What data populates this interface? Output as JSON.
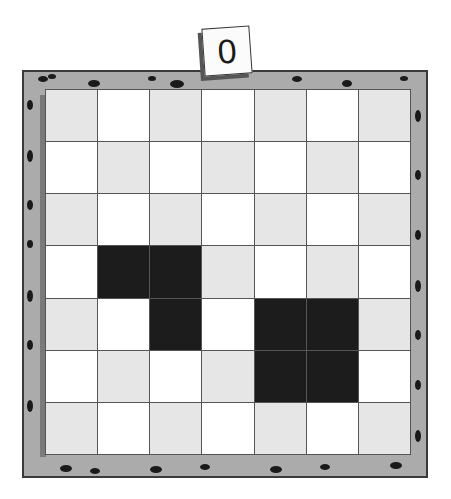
{
  "game": {
    "title": "Grid puzzle board",
    "score": "0",
    "rows": 7,
    "cols": 7,
    "colors": {
      "frame": "#ababab",
      "frame_border": "#3a3a3a",
      "light_cell": "#e6e6e6",
      "white_cell": "#ffffff",
      "filled_cell": "#1c1c1c"
    },
    "filled_cells": [
      [
        3,
        1
      ],
      [
        3,
        2
      ],
      [
        4,
        2
      ],
      [
        4,
        4
      ],
      [
        4,
        5
      ],
      [
        5,
        4
      ],
      [
        5,
        5
      ]
    ]
  }
}
